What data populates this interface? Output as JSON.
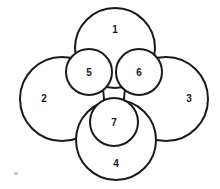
{
  "diagram": {
    "background_color": "#ffffff",
    "stroke_color": "#1a1a1a",
    "fill_color": "#ffffff",
    "label_color": "#1a1a1a",
    "canvas": {
      "width": 220,
      "height": 189
    },
    "outer_lobes": [
      {
        "id": "lobe-1",
        "label": "1",
        "position": "top",
        "center_x": 115,
        "center_y": 48,
        "radius": 40,
        "label_x": 115,
        "label_y": 30,
        "stroke_width": 2
      },
      {
        "id": "lobe-2",
        "label": "2",
        "position": "left",
        "center_x": 62,
        "center_y": 99,
        "radius": 42,
        "label_x": 44,
        "label_y": 99,
        "stroke_width": 2
      },
      {
        "id": "lobe-3",
        "label": "3",
        "position": "right",
        "center_x": 166,
        "center_y": 99,
        "radius": 42,
        "label_x": 189,
        "label_y": 99,
        "stroke_width": 2
      },
      {
        "id": "lobe-4",
        "label": "4",
        "position": "bottom",
        "center_x": 116,
        "center_y": 140,
        "radius": 40,
        "label_x": 116,
        "label_y": 164,
        "stroke_width": 2
      }
    ],
    "inner_circles": [
      {
        "id": "circle-5",
        "label": "5",
        "position": "upper-left",
        "center_x": 89,
        "center_y": 72,
        "radius": 23,
        "label_x": 89,
        "label_y": 73,
        "stroke_width": 2
      },
      {
        "id": "circle-6",
        "label": "6",
        "position": "upper-right",
        "center_x": 139,
        "center_y": 72,
        "radius": 23,
        "label_x": 139,
        "label_y": 73,
        "stroke_width": 2
      },
      {
        "id": "circle-7",
        "label": "7",
        "position": "lower-center",
        "center_x": 114,
        "center_y": 122,
        "radius": 24,
        "label_x": 114,
        "label_y": 123,
        "stroke_width": 2
      }
    ],
    "label_font_size": 10,
    "artifact": {
      "id": "scan-speck",
      "x": 14,
      "y": 172,
      "width": 4,
      "height": 3
    }
  }
}
